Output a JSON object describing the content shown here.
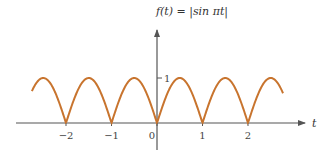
{
  "chart_data": {
    "type": "line",
    "title": "f(t) = |sin πt|",
    "xlabel": "t",
    "ylabel": "",
    "function": "abs(sin(pi*t))",
    "x_range": [
      -2.75,
      2.77
    ],
    "xlim": [
      -3.4,
      3.6
    ],
    "ylim": [
      -0.8,
      2.0
    ],
    "x_ticks": [
      -2,
      -1,
      0,
      1,
      2
    ],
    "x_tick_labels": [
      "−2",
      "−1",
      "0",
      "1",
      "2"
    ],
    "y_ticks": [
      1
    ],
    "y_tick_labels": [
      "1"
    ],
    "grid": false,
    "legend": "none",
    "colors": {
      "curve": "#c8742e",
      "axis": "#555555"
    }
  }
}
